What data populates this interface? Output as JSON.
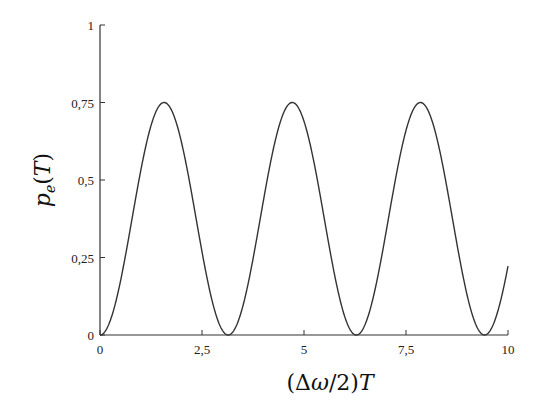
{
  "chart_data": {
    "type": "line",
    "title": "",
    "xlabel": "(Δω/2)T",
    "ylabel": "p_e(T)",
    "xlim": [
      0,
      10
    ],
    "ylim": [
      0,
      1
    ],
    "xticks": [
      0,
      2.5,
      5,
      7.5,
      10
    ],
    "xtick_labels": [
      "0",
      "2,5",
      "5",
      "7,5",
      "10"
    ],
    "yticks": [
      0,
      0.25,
      0.5,
      0.75,
      1
    ],
    "ytick_labels": [
      "0",
      "0,25",
      "0,5",
      "0,75",
      "1"
    ],
    "grid": false,
    "legend": null,
    "series": [
      {
        "name": "p_e(T)",
        "function": "0.75*sin(x)^2",
        "x": [
          0,
          0.5,
          1.0,
          1.5708,
          2.0,
          2.5,
          3.1416,
          3.5,
          4.0,
          4.7124,
          5.5,
          6.2832,
          7.0,
          7.854,
          8.5,
          9.4248,
          10.0
        ],
        "y": [
          0,
          0.172,
          0.531,
          0.75,
          0.62,
          0.269,
          0,
          0.092,
          0.43,
          0.75,
          0.369,
          0,
          0.324,
          0.75,
          0.473,
          0,
          0.222
        ]
      }
    ],
    "color": "#333333"
  }
}
